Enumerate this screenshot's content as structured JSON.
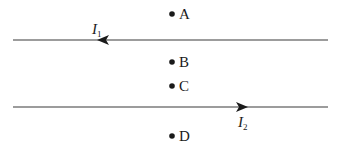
{
  "diagram": {
    "type": "two parallel current-carrying wires with labeled points",
    "colors": {
      "line": "#3a3a3a",
      "ink": "#1a1a1a",
      "background": "#ffffff"
    },
    "wires": [
      {
        "id": "wire-1",
        "label": "I",
        "subscript": "1",
        "direction": "left",
        "y": 40,
        "x_start": 13,
        "x_end": 328,
        "arrow_x": 105,
        "label_x": 92,
        "label_y": 33
      },
      {
        "id": "wire-2",
        "label": "I",
        "subscript": "2",
        "direction": "right",
        "y": 107,
        "x_start": 13,
        "x_end": 328,
        "arrow_x": 242,
        "label_x": 238,
        "label_y": 127
      }
    ],
    "points": [
      {
        "label": "A",
        "x": 172,
        "y": 14
      },
      {
        "label": "B",
        "x": 172,
        "y": 62
      },
      {
        "label": "C",
        "x": 172,
        "y": 86
      },
      {
        "label": "D",
        "x": 172,
        "y": 136
      }
    ]
  }
}
